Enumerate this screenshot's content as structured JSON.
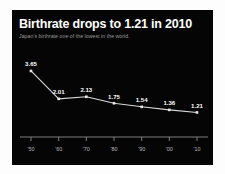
{
  "chart": {
    "title": "Birthrate drops to 1.21 in 2010",
    "subtitle": "Japan's birthrate one of the lowest in the world.",
    "background_color": "#050505",
    "line_color": "#d8d8d8",
    "label_color": "#ffffff",
    "axis_color": "#8d8d8d"
  },
  "chart_data": {
    "type": "line",
    "title": "Birthrate drops to 1.21 in 2010",
    "subtitle": "Japan's birthrate one of the lowest in the world.",
    "xlabel": "",
    "ylabel": "",
    "categories": [
      "'50",
      "'60",
      "'70",
      "'80",
      "'90",
      "'00",
      "'10"
    ],
    "values": [
      3.65,
      2.01,
      2.13,
      1.75,
      1.54,
      1.36,
      1.21
    ],
    "point_labels": [
      "3.65",
      "2.01",
      "2.13",
      "1.75",
      "1.54",
      "1.36",
      "1.21"
    ],
    "ylim": [
      0,
      4.0
    ],
    "grid": false,
    "legend": false,
    "series": [
      {
        "name": "Japan total fertility rate",
        "values": [
          3.65,
          2.01,
          2.13,
          1.75,
          1.54,
          1.36,
          1.21
        ]
      }
    ]
  }
}
